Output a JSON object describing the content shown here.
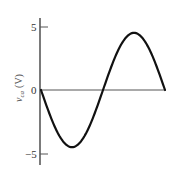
{
  "chart_data": {
    "type": "line",
    "title": "",
    "xlabel": "",
    "ylabel": "v_ca (V)",
    "ylabel_parts": {
      "symbol": "v",
      "subscript": "ca",
      "unit": "(V)"
    },
    "yticks": [
      5,
      0,
      -5
    ],
    "ytick_labels": [
      "5",
      "0",
      "−5"
    ],
    "ylim": [
      -5,
      5
    ],
    "xlim": [
      0,
      1
    ],
    "grid": false,
    "legend": null,
    "series": [
      {
        "name": "v_ca",
        "description": "one full cycle of a negative sine wave, amplitude ~4.5 V",
        "amplitude": 4.5,
        "x": [
          0,
          0.125,
          0.25,
          0.375,
          0.5,
          0.625,
          0.75,
          0.875,
          1.0
        ],
        "values": [
          0,
          -3.2,
          -4.5,
          -3.2,
          0,
          3.2,
          4.5,
          3.2,
          0
        ]
      }
    ]
  }
}
